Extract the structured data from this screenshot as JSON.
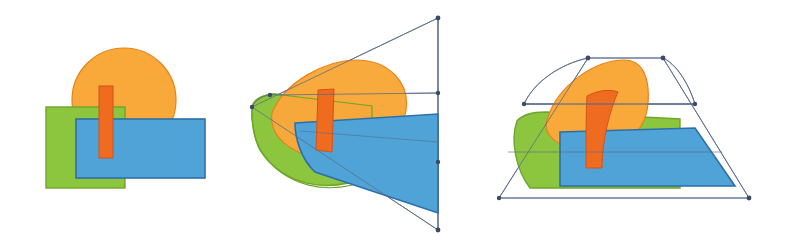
{
  "document": {
    "title": "Shape composition perspective warp sequence",
    "background_color": "#ffffff",
    "width": 794,
    "height": 248,
    "panel_count": 3
  },
  "palette": {
    "green_fill": "#8CC63E",
    "green_stroke": "#6FA52B",
    "blue_fill": "#4FA3D6",
    "blue_stroke": "#2E6FA8",
    "orange_fill": "#F9A93A",
    "orange_stroke": "#E8801B",
    "red_fill": "#EE6B20",
    "red_stroke": "#D4531A",
    "mesh_stroke": "#5A6B8C",
    "handle_fill": "#3A4A66",
    "background": "#ffffff"
  },
  "panels": [
    {
      "id": "panel-original",
      "name": "original-composition",
      "label": "Original",
      "has_mesh": false,
      "shapes": [
        {
          "name": "orange-circle",
          "type": "ellipse",
          "cx": 124,
          "cy": 100,
          "rx": 52,
          "ry": 52
        },
        {
          "name": "green-square",
          "type": "rect",
          "x": 46,
          "y": 107,
          "width": 79,
          "height": 81
        },
        {
          "name": "blue-rectangle",
          "type": "rect",
          "x": 76,
          "y": 119,
          "width": 129,
          "height": 59
        },
        {
          "name": "red-bar",
          "type": "rect",
          "x": 99,
          "y": 86,
          "width": 14,
          "height": 72
        }
      ]
    },
    {
      "id": "panel-warp-a",
      "name": "perspective-warp-wedge",
      "label": "Perspective warp - wedge",
      "has_mesh": true,
      "mesh_corners": [
        {
          "name": "mesh-handle-top-left",
          "x": 12,
          "y": 107
        },
        {
          "name": "mesh-handle-top-right",
          "x": 198,
          "y": 18
        },
        {
          "name": "mesh-handle-bottom-right",
          "x": 198,
          "y": 230
        },
        {
          "name": "mesh-handle-bottom-left",
          "x": 12,
          "y": 107
        }
      ],
      "mesh_edge_handles": [
        {
          "name": "mesh-handle-upper-mid",
          "x": 30,
          "y": 95
        },
        {
          "name": "mesh-handle-right-mid",
          "x": 198,
          "y": 93
        },
        {
          "name": "mesh-handle-right-low",
          "x": 198,
          "y": 162
        }
      ],
      "shapes": [
        {
          "name": "orange-circle-warped",
          "type": "path"
        },
        {
          "name": "green-square-warped",
          "type": "path"
        },
        {
          "name": "blue-rectangle-warped",
          "type": "path"
        },
        {
          "name": "red-bar-warped",
          "type": "path"
        }
      ]
    },
    {
      "id": "panel-warp-b",
      "name": "perspective-warp-trapezoid",
      "label": "Perspective warp - trapezoid",
      "has_mesh": true,
      "mesh_corners": [
        {
          "name": "mesh-handle-top-left",
          "x": 98,
          "y": 58
        },
        {
          "name": "mesh-handle-top-right",
          "x": 173,
          "y": 58
        },
        {
          "name": "mesh-handle-bottom-right",
          "x": 259,
          "y": 198
        },
        {
          "name": "mesh-handle-bottom-left",
          "x": 9,
          "y": 198
        }
      ],
      "mesh_edge_handles": [
        {
          "name": "mesh-handle-left-mid",
          "x": 34,
          "y": 104
        },
        {
          "name": "mesh-handle-right-mid",
          "x": 205,
          "y": 104
        }
      ],
      "shapes": [
        {
          "name": "orange-circle-warped",
          "type": "path"
        },
        {
          "name": "green-square-warped",
          "type": "path"
        },
        {
          "name": "blue-rectangle-warped",
          "type": "path"
        },
        {
          "name": "red-bar-warped",
          "type": "path"
        }
      ]
    }
  ]
}
